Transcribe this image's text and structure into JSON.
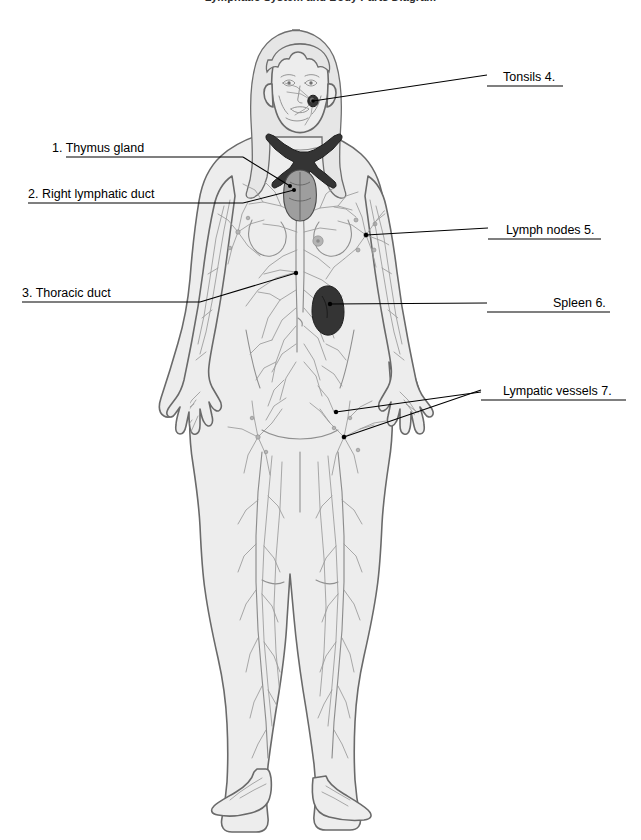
{
  "document": {
    "title": "Lymphatic System and Body Parts Diagram",
    "type": "anatomical-diagram",
    "subject": "human lymphatic system",
    "figure_description": "Full-body front view of a female figure showing the lymphatic system: tonsils, thymus gland, right lymphatic duct, thoracic duct, lymph nodes, spleen and lymphatic vessels."
  },
  "labels": [
    {
      "id": "thymus-gland",
      "number": "1.",
      "text": "1. Thymus gland",
      "side": "left",
      "label_x": 52,
      "label_y": 141,
      "underline_from_x": 66,
      "underline_to_x": 243,
      "underline_y": 157,
      "leader": [
        [
          243,
          157
        ],
        [
          290,
          186
        ]
      ],
      "dot": [
        290,
        186
      ]
    },
    {
      "id": "right-lymphatic-duct",
      "number": "2.",
      "text": "2. Right lymphatic duct",
      "side": "left",
      "label_x": 28,
      "label_y": 187,
      "underline_from_x": 28,
      "underline_to_x": 243,
      "underline_y": 203,
      "leader": [
        [
          243,
          203
        ],
        [
          294,
          190
        ]
      ],
      "dot": [
        294,
        190
      ]
    },
    {
      "id": "thoracic-duct",
      "number": "3.",
      "text": "3. Thoracic duct",
      "side": "left",
      "label_x": 22,
      "label_y": 286,
      "underline_from_x": 22,
      "underline_to_x": 200,
      "underline_y": 302,
      "leader": [
        [
          200,
          302
        ],
        [
          296,
          273
        ]
      ],
      "dot": [
        296,
        273
      ]
    },
    {
      "id": "tonsils",
      "number": "4.",
      "text": "Tonsils 4.",
      "side": "right",
      "label_x": 503,
      "label_y": 70,
      "underline_from_x": 487,
      "underline_to_x": 563,
      "underline_y": 86,
      "leader": [
        [
          487,
          75
        ],
        [
          313,
          101
        ]
      ],
      "dot": [
        313,
        101
      ]
    },
    {
      "id": "lymph-nodes",
      "number": "5.",
      "text": "Lymph nodes 5.",
      "side": "right",
      "label_x": 506,
      "label_y": 223,
      "underline_from_x": 488,
      "underline_to_x": 601,
      "underline_y": 239,
      "leader": [
        [
          488,
          228
        ],
        [
          366,
          235
        ]
      ],
      "dot": [
        366,
        235
      ]
    },
    {
      "id": "spleen",
      "number": "6.",
      "text": "Spleen 6.",
      "side": "right",
      "label_x": 553,
      "label_y": 296,
      "underline_from_x": 487,
      "underline_to_x": 610,
      "underline_y": 312,
      "leader": [
        [
          487,
          303
        ],
        [
          330,
          304
        ]
      ],
      "dot": [
        330,
        304
      ]
    },
    {
      "id": "lympatic-vessels",
      "number": "7.",
      "text": "Lympatic vessels 7.",
      "side": "right",
      "label_x": 503,
      "label_y": 384,
      "underline_from_x": 481,
      "underline_to_x": 626,
      "underline_y": 400,
      "leader": [
        [
          481,
          390
        ],
        [
          344,
          437
        ]
      ],
      "dot": [
        344,
        437
      ]
    }
  ],
  "structures": [
    {
      "name": "tonsils",
      "marker": "dark-node",
      "x": 313,
      "y": 101
    },
    {
      "name": "thymus-gland",
      "marker": "grey-lobed-organ",
      "x": 297,
      "y": 190
    },
    {
      "name": "right-lymphatic-duct",
      "marker": "dark-branching-duct",
      "x": 292,
      "y": 165
    },
    {
      "name": "thoracic-duct",
      "marker": "vessel-trunk",
      "x": 296,
      "y": 273
    },
    {
      "name": "lymph-nodes",
      "marker": "axillary-node-cluster",
      "x": 366,
      "y": 235
    },
    {
      "name": "spleen",
      "marker": "dark-bean-organ",
      "x": 330,
      "y": 304
    },
    {
      "name": "lympatic-vessels",
      "marker": "inguinal-vessel-network",
      "x": 344,
      "y": 437
    }
  ],
  "colors": {
    "background": "#ffffff",
    "skin_fill": "#ededed",
    "outline": "#6a6a6a",
    "vessel": "#8d8d8d",
    "organ_dark": "#3a3a3a",
    "organ_grey": "#9a9a9a",
    "leader_line": "#000000",
    "text": "#000000"
  }
}
